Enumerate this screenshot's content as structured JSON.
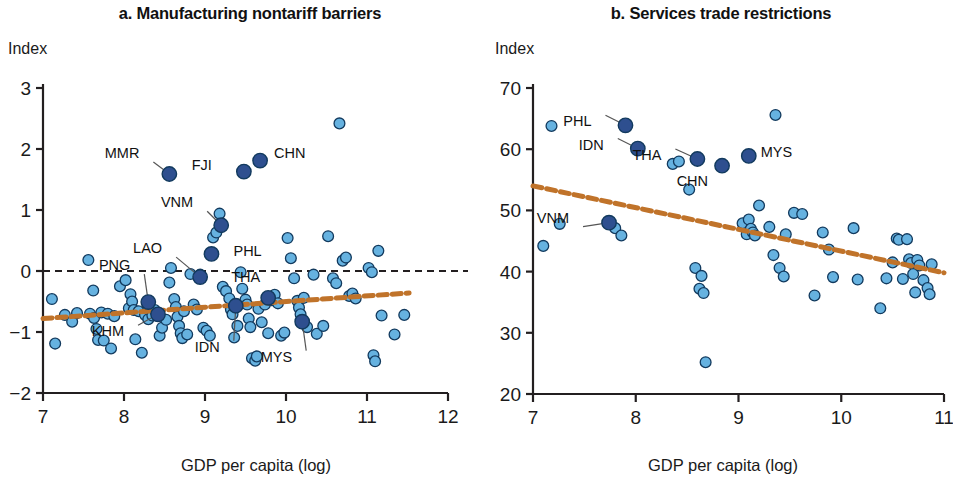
{
  "panels": [
    {
      "id": "a",
      "title": "a. Manufacturing nontariff barriers",
      "y_axis_unit": "Index",
      "x_axis_label": "GDP per capita (log)"
    },
    {
      "id": "b",
      "title": "b. Services trade restrictions",
      "y_axis_unit": "Index",
      "x_axis_label": "GDP per capita (log)"
    }
  ],
  "colors": {
    "point_light_fill": "#66b2e0",
    "point_dark_fill": "#2e4f8f",
    "point_stroke": "#123a5e",
    "trend_line": "#c0732a",
    "axis": "#231f20",
    "zero_line": "#231f20"
  },
  "chart_data": [
    {
      "type": "scatter",
      "panel": "a",
      "title": "a. Manufacturing nontariff barriers",
      "xlabel": "GDP per capita (log)",
      "ylabel": "Index",
      "xlim": [
        7,
        12
      ],
      "ylim": [
        -2,
        3
      ],
      "xticks": [
        7,
        8,
        9,
        10,
        11,
        12
      ],
      "yticks": [
        -2,
        -1,
        0,
        1,
        2,
        3
      ],
      "xtick_labels": [
        "7",
        "8",
        "9",
        "10",
        "11",
        "12"
      ],
      "ytick_labels": [
        "−2",
        "−1",
        "0",
        "1",
        "2",
        "3"
      ],
      "grid": false,
      "legend": "none",
      "zero_reference_line": {
        "y": 0,
        "style": "dashed"
      },
      "trend_line": {
        "style": "dashed",
        "x_start": 7.0,
        "y_start": -0.78,
        "x_end": 11.52,
        "y_end": -0.36
      },
      "highlighted_points": [
        {
          "label": "MMR",
          "x": 8.56,
          "y": 1.59,
          "label_dx": -30,
          "label_dy": -16
        },
        {
          "label": "FJI",
          "x": 9.48,
          "y": 1.63,
          "label_dx": -32,
          "label_dy": -2
        },
        {
          "label": "CHN",
          "x": 9.68,
          "y": 1.81,
          "label_dx": 14,
          "label_dy": -3
        },
        {
          "label": "VNM",
          "x": 9.2,
          "y": 0.75,
          "label_dx": -28,
          "label_dy": -18
        },
        {
          "label": "PHL",
          "x": 9.08,
          "y": 0.28,
          "label_dx": 22,
          "label_dy": 2
        },
        {
          "label": "LAO",
          "x": 8.94,
          "y": -0.1,
          "label_dx": -38,
          "label_dy": -24
        },
        {
          "label": "PNG",
          "x": 8.3,
          "y": -0.51,
          "label_dx": -18,
          "label_dy": -32
        },
        {
          "label": "KHM",
          "x": 8.42,
          "y": -0.71,
          "label_dx": -34,
          "label_dy": 22
        },
        {
          "label": "IDN",
          "x": 9.38,
          "y": -0.57,
          "label_dx": -16,
          "label_dy": 46
        },
        {
          "label": "THA",
          "x": 9.78,
          "y": -0.44,
          "label_dx": -8,
          "label_dy": -16
        },
        {
          "label": "MYS",
          "x": 10.2,
          "y": -0.83,
          "label_dx": -10,
          "label_dy": 40
        }
      ],
      "points": [
        [
          7.11,
          -0.46
        ],
        [
          7.15,
          -1.19
        ],
        [
          7.27,
          -0.72
        ],
        [
          7.36,
          -0.83
        ],
        [
          7.42,
          -0.69
        ],
        [
          7.56,
          0.18
        ],
        [
          7.58,
          -0.7
        ],
        [
          7.62,
          -0.32
        ],
        [
          7.63,
          -0.77
        ],
        [
          7.66,
          -0.95
        ],
        [
          7.68,
          -1.13
        ],
        [
          7.72,
          -0.68
        ],
        [
          7.75,
          -1.14
        ],
        [
          7.8,
          -0.7
        ],
        [
          7.84,
          -1.27
        ],
        [
          7.88,
          -0.74
        ],
        [
          7.95,
          -0.25
        ],
        [
          8.02,
          -0.15
        ],
        [
          8.06,
          -0.61
        ],
        [
          8.08,
          -0.38
        ],
        [
          8.1,
          -0.5
        ],
        [
          8.12,
          -0.64
        ],
        [
          8.14,
          -1.12
        ],
        [
          8.18,
          -0.66
        ],
        [
          8.22,
          -1.34
        ],
        [
          8.26,
          -0.72
        ],
        [
          8.3,
          -0.79
        ],
        [
          8.35,
          -0.73
        ],
        [
          8.38,
          -0.64
        ],
        [
          8.44,
          -1.06
        ],
        [
          8.47,
          -0.93
        ],
        [
          8.52,
          -0.8
        ],
        [
          8.56,
          -0.19
        ],
        [
          8.58,
          0.05
        ],
        [
          8.62,
          -0.46
        ],
        [
          8.64,
          -0.59
        ],
        [
          8.66,
          -0.75
        ],
        [
          8.68,
          -0.9
        ],
        [
          8.7,
          -1.02
        ],
        [
          8.72,
          -1.1
        ],
        [
          8.74,
          -0.66
        ],
        [
          8.78,
          -1.04
        ],
        [
          8.82,
          -0.05
        ],
        [
          8.86,
          -0.55
        ],
        [
          8.9,
          -0.63
        ],
        [
          8.94,
          -0.06
        ],
        [
          8.98,
          -0.93
        ],
        [
          9.02,
          -0.98
        ],
        [
          9.06,
          -1.06
        ],
        [
          9.1,
          0.55
        ],
        [
          9.14,
          0.63
        ],
        [
          9.18,
          0.94
        ],
        [
          9.22,
          -0.26
        ],
        [
          9.26,
          -0.33
        ],
        [
          9.3,
          -0.45
        ],
        [
          9.32,
          -0.63
        ],
        [
          9.34,
          -0.71
        ],
        [
          9.36,
          -1.09
        ],
        [
          9.4,
          -0.9
        ],
        [
          9.44,
          -0.02
        ],
        [
          9.46,
          -0.29
        ],
        [
          9.5,
          -0.47
        ],
        [
          9.52,
          -0.55
        ],
        [
          9.54,
          -0.78
        ],
        [
          9.56,
          -0.92
        ],
        [
          9.58,
          -1.43
        ],
        [
          9.62,
          -1.47
        ],
        [
          9.64,
          -1.4
        ],
        [
          9.66,
          -0.62
        ],
        [
          9.7,
          -0.84
        ],
        [
          9.74,
          -0.55
        ],
        [
          9.78,
          -1.02
        ],
        [
          9.82,
          -0.48
        ],
        [
          9.86,
          -0.39
        ],
        [
          9.9,
          -0.53
        ],
        [
          9.94,
          -1.06
        ],
        [
          9.98,
          -1.01
        ],
        [
          10.02,
          0.54
        ],
        [
          10.06,
          0.21
        ],
        [
          10.1,
          -0.12
        ],
        [
          10.14,
          -0.49
        ],
        [
          10.16,
          -0.6
        ],
        [
          10.18,
          -0.71
        ],
        [
          10.22,
          -0.44
        ],
        [
          10.26,
          -0.92
        ],
        [
          10.34,
          -0.06
        ],
        [
          10.38,
          -1.03
        ],
        [
          10.46,
          -0.9
        ],
        [
          10.52,
          0.57
        ],
        [
          10.58,
          -0.12
        ],
        [
          10.62,
          -0.2
        ],
        [
          10.66,
          2.42
        ],
        [
          10.7,
          0.17
        ],
        [
          10.74,
          0.22
        ],
        [
          10.78,
          -0.41
        ],
        [
          10.82,
          -0.37
        ],
        [
          10.86,
          -0.45
        ],
        [
          11.02,
          0.05
        ],
        [
          11.06,
          -0.02
        ],
        [
          11.08,
          -1.38
        ],
        [
          11.1,
          -1.48
        ],
        [
          11.14,
          0.33
        ],
        [
          11.18,
          -0.73
        ],
        [
          11.34,
          -1.04
        ],
        [
          11.46,
          -0.72
        ]
      ]
    },
    {
      "type": "scatter",
      "panel": "b",
      "title": "b. Services trade restrictions",
      "xlabel": "GDP per capita (log)",
      "ylabel": "Index",
      "xlim": [
        7,
        11
      ],
      "ylim": [
        20,
        70
      ],
      "xticks": [
        7,
        8,
        9,
        10,
        11
      ],
      "yticks": [
        20,
        30,
        40,
        50,
        60,
        70
      ],
      "xtick_labels": [
        "7",
        "8",
        "9",
        "10",
        "11"
      ],
      "ytick_labels": [
        "20",
        "30",
        "40",
        "50",
        "60",
        "70"
      ],
      "grid": false,
      "legend": "none",
      "trend_line": {
        "style": "dashed",
        "x_start": 7.0,
        "y_start": 54.0,
        "x_end": 11.0,
        "y_end": 39.8
      },
      "highlighted_points": [
        {
          "label": "PHL",
          "x": 7.9,
          "y": 63.9,
          "label_dx": -34,
          "label_dy": 1
        },
        {
          "label": "IDN",
          "x": 8.02,
          "y": 60.1,
          "label_dx": -34,
          "label_dy": 1
        },
        {
          "label": "THA",
          "x": 8.6,
          "y": 58.4,
          "label_dx": -36,
          "label_dy": 1
        },
        {
          "label": "CHN",
          "x": 8.84,
          "y": 57.3,
          "label_dx": -14,
          "label_dy": 20
        },
        {
          "label": "MYS",
          "x": 9.1,
          "y": 58.9,
          "label_dx": 12,
          "label_dy": 1
        },
        {
          "label": "VNM",
          "x": 7.74,
          "y": 48.0,
          "label_dx": -40,
          "label_dy": 0
        }
      ],
      "points": [
        [
          7.1,
          44.2
        ],
        [
          7.18,
          63.8
        ],
        [
          7.26,
          47.8
        ],
        [
          7.8,
          47.1
        ],
        [
          7.86,
          45.9
        ],
        [
          8.36,
          57.6
        ],
        [
          8.42,
          58.0
        ],
        [
          8.52,
          53.4
        ],
        [
          8.58,
          40.6
        ],
        [
          8.62,
          37.2
        ],
        [
          8.64,
          39.3
        ],
        [
          8.66,
          36.5
        ],
        [
          8.68,
          25.2
        ],
        [
          9.04,
          47.9
        ],
        [
          9.08,
          46.1
        ],
        [
          9.1,
          48.5
        ],
        [
          9.12,
          47.0
        ],
        [
          9.14,
          46.4
        ],
        [
          9.16,
          45.9
        ],
        [
          9.2,
          50.8
        ],
        [
          9.3,
          47.3
        ],
        [
          9.34,
          42.7
        ],
        [
          9.36,
          65.6
        ],
        [
          9.4,
          40.6
        ],
        [
          9.44,
          39.2
        ],
        [
          9.46,
          46.1
        ],
        [
          9.54,
          49.6
        ],
        [
          9.62,
          49.4
        ],
        [
          9.74,
          36.1
        ],
        [
          9.82,
          46.4
        ],
        [
          9.88,
          43.6
        ],
        [
          9.92,
          39.1
        ],
        [
          10.12,
          47.1
        ],
        [
          10.16,
          38.7
        ],
        [
          10.38,
          34.0
        ],
        [
          10.44,
          38.9
        ],
        [
          10.5,
          41.5
        ],
        [
          10.54,
          45.4
        ],
        [
          10.56,
          45.2
        ],
        [
          10.6,
          38.8
        ],
        [
          10.64,
          45.3
        ],
        [
          10.66,
          42.0
        ],
        [
          10.68,
          41.4
        ],
        [
          10.7,
          39.6
        ],
        [
          10.72,
          36.6
        ],
        [
          10.74,
          41.9
        ],
        [
          10.76,
          41.0
        ],
        [
          10.8,
          38.6
        ],
        [
          10.84,
          37.3
        ],
        [
          10.86,
          36.3
        ],
        [
          10.88,
          41.2
        ]
      ]
    }
  ]
}
